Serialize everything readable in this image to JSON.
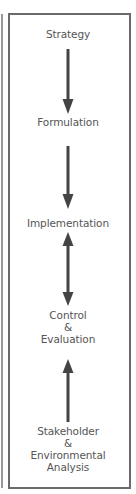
{
  "diagram": {
    "colors": {
      "frame_border": "#6a6a6a",
      "text": "#555555",
      "arrow": "#444444",
      "background": "#ffffff"
    },
    "nodes": [
      {
        "id": "strategy",
        "lines": [
          "Strategy"
        ]
      },
      {
        "id": "formulation",
        "lines": [
          "Formulation"
        ]
      },
      {
        "id": "implementation",
        "lines": [
          "Implementation"
        ]
      },
      {
        "id": "control-evaluation",
        "lines": [
          "Control",
          "&",
          "Evaluation"
        ]
      },
      {
        "id": "stakeholder-analysis",
        "lines": [
          "Stakeholder",
          "&",
          "Environmental",
          "Analysis"
        ]
      }
    ],
    "edges": [
      {
        "from": "strategy",
        "to": "formulation",
        "direction": "down"
      },
      {
        "from": "formulation",
        "to": "implementation",
        "direction": "down"
      },
      {
        "from": "implementation",
        "to": "control-evaluation",
        "direction": "bidirectional"
      },
      {
        "from": "stakeholder-analysis",
        "to": "control-evaluation",
        "direction": "up"
      }
    ]
  }
}
